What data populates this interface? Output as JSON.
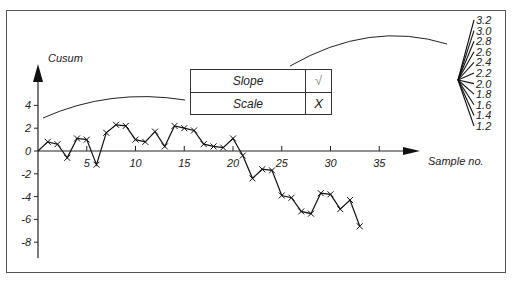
{
  "chart_data": {
    "type": "line",
    "title": "",
    "ylabel": "Cusum",
    "xlabel": "Sample no.",
    "x": [
      1,
      2,
      3,
      4,
      5,
      6,
      7,
      8,
      9,
      10,
      11,
      12,
      13,
      14,
      15,
      16,
      17,
      18,
      19,
      20,
      21,
      22,
      23,
      24,
      25,
      26,
      27,
      28,
      29,
      30,
      31,
      32,
      33
    ],
    "values": [
      0.8,
      0.6,
      -0.6,
      1.1,
      1.0,
      -1.2,
      1.6,
      2.3,
      2.2,
      1.0,
      0.8,
      1.7,
      0.4,
      2.2,
      2.0,
      1.8,
      0.6,
      0.4,
      0.3,
      1.1,
      -0.4,
      -2.4,
      -1.6,
      -1.7,
      -3.9,
      -4.1,
      -5.3,
      -5.5,
      -3.7,
      -3.8,
      -5.1,
      -4.3,
      -6.6
    ],
    "start": {
      "x": 0,
      "y": 0
    },
    "xticks": [
      "5",
      "10",
      "15",
      "20",
      "25",
      "30",
      "35"
    ],
    "yticks": [
      "4",
      "2",
      "0",
      "-2",
      "-4",
      "-6",
      "-8"
    ],
    "marker": "x",
    "grid": false
  },
  "key_table": {
    "rows": [
      {
        "label": "Slope",
        "mark": "√"
      },
      {
        "label": "Scale",
        "mark": "X"
      }
    ]
  },
  "slope_fan": {
    "labels": [
      "3.2",
      "3.0",
      "2.8",
      "2.6",
      "2.4",
      "2.2",
      "2.0",
      "1.8",
      "1.6",
      "1.4",
      "1.2"
    ]
  }
}
